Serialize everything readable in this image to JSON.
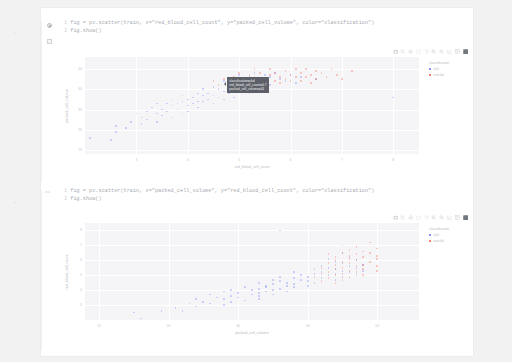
{
  "notebook": {
    "cells": [
      {
        "marker": "run-indicator",
        "gutter": "",
        "lines": [
          {
            "n": "1",
            "text": "fig = px.scatter(train, x=\"red_blood_cell_count\", y=\"packed_cell_volume\", color=\"classification\")"
          },
          {
            "n": "2",
            "text": "fig.show()"
          }
        ],
        "output_icon": "output-collapse-icon"
      },
      {
        "marker": "execution-count",
        "gutter": "xc",
        "lines": [
          {
            "n": "1",
            "text": "fig = px.scatter(train, x=\"packed_cell_volume\", y=\"red_blood_cell_count\", color=\"classification\")"
          },
          {
            "n": "2",
            "text": "fig.show()"
          }
        ],
        "output_icon": ""
      }
    ]
  },
  "modebar": {
    "buttons": [
      {
        "icon": "camera-icon",
        "label": "Download plot as a png"
      },
      {
        "icon": "zoom-icon",
        "label": "Zoom"
      },
      {
        "icon": "pan-icon",
        "label": "Pan"
      },
      {
        "icon": "select-box-icon",
        "label": "Box Select"
      },
      {
        "icon": "lasso-icon",
        "label": "Lasso Select"
      },
      {
        "icon": "zoom-in-icon",
        "label": "Zoom in"
      },
      {
        "icon": "zoom-out-icon",
        "label": "Zoom out"
      },
      {
        "icon": "autoscale-icon",
        "label": "Autoscale"
      },
      {
        "icon": "reset-axes-icon",
        "label": "Reset axes"
      },
      {
        "icon": "plotly-logo-icon",
        "label": "Produced with Plotly"
      }
    ]
  },
  "colors": {
    "ckd": "#636efa",
    "notckd": "#ef553b",
    "plot_bg": "#f5f5f7",
    "grid": "#ffffff",
    "tooltip_bg": "#5d6068"
  },
  "tooltip": {
    "lines": [
      "classification=ckd",
      "red_blood_cell_count=4.7",
      "packed_cell_volume=44"
    ]
  },
  "chart_data": [
    {
      "type": "scatter",
      "title": "",
      "xlabel": "red_blood_cell_count",
      "ylabel": "packed_cell_volume",
      "xlim": [
        2.0,
        8.5
      ],
      "ylim": [
        8,
        56
      ],
      "xticks": [
        "3",
        "4",
        "5",
        "6",
        "7",
        "8"
      ],
      "yticks": [
        "10",
        "20",
        "30",
        "40",
        "50"
      ],
      "grid": true,
      "legend": {
        "title": "classification",
        "position": "right",
        "entries": [
          "ckd",
          "notckd"
        ]
      },
      "series": [
        {
          "name": "ckd",
          "color": "#636efa",
          "points": [
            [
              2.1,
              16
            ],
            [
              2.5,
              15
            ],
            [
              2.6,
              22
            ],
            [
              2.6,
              19
            ],
            [
              2.8,
              21
            ],
            [
              2.9,
              24
            ],
            [
              3.0,
              28
            ],
            [
              3.1,
              26
            ],
            [
              3.1,
              23
            ],
            [
              3.2,
              29
            ],
            [
              3.2,
              25
            ],
            [
              3.3,
              31
            ],
            [
              3.4,
              28
            ],
            [
              3.4,
              33
            ],
            [
              3.4,
              24
            ],
            [
              3.5,
              30
            ],
            [
              3.5,
              27
            ],
            [
              3.6,
              33
            ],
            [
              3.6,
              29
            ],
            [
              3.7,
              32
            ],
            [
              3.7,
              26
            ],
            [
              3.7,
              35
            ],
            [
              3.8,
              33
            ],
            [
              3.8,
              30
            ],
            [
              3.9,
              34
            ],
            [
              3.9,
              28
            ],
            [
              3.9,
              37
            ],
            [
              4.0,
              32
            ],
            [
              4.0,
              35
            ],
            [
              4.0,
              29
            ],
            [
              4.1,
              36
            ],
            [
              4.1,
              33
            ],
            [
              4.2,
              38
            ],
            [
              4.2,
              34
            ],
            [
              4.2,
              31
            ],
            [
              4.3,
              37
            ],
            [
              4.3,
              40
            ],
            [
              4.3,
              34
            ],
            [
              4.4,
              38
            ],
            [
              4.4,
              35
            ],
            [
              4.5,
              41
            ],
            [
              4.5,
              37
            ],
            [
              4.5,
              33
            ],
            [
              4.6,
              40
            ],
            [
              4.6,
              36
            ],
            [
              4.7,
              44
            ],
            [
              4.7,
              39
            ],
            [
              4.7,
              35
            ],
            [
              4.8,
              42
            ],
            [
              4.8,
              38
            ],
            [
              4.9,
              45
            ],
            [
              4.9,
              40
            ],
            [
              4.9,
              36
            ],
            [
              5.0,
              43
            ],
            [
              5.0,
              39
            ],
            [
              5.0,
              47
            ],
            [
              5.1,
              44
            ],
            [
              5.1,
              41
            ],
            [
              5.2,
              46
            ],
            [
              5.2,
              42
            ],
            [
              5.2,
              38
            ],
            [
              5.3,
              45
            ],
            [
              5.3,
              48
            ],
            [
              5.4,
              44
            ],
            [
              5.4,
              41
            ],
            [
              5.5,
              47
            ],
            [
              5.5,
              43
            ],
            [
              5.6,
              46
            ],
            [
              5.6,
              42
            ],
            [
              5.7,
              48
            ],
            [
              5.8,
              45
            ],
            [
              5.9,
              44
            ],
            [
              6.0,
              47
            ],
            [
              6.1,
              43
            ],
            [
              6.2,
              46
            ],
            [
              6.5,
              45
            ],
            [
              8.0,
              36
            ]
          ]
        },
        {
          "name": "notckd",
          "color": "#ef553b",
          "points": [
            [
              4.5,
              44
            ],
            [
              4.6,
              42
            ],
            [
              4.7,
              45
            ],
            [
              4.8,
              43
            ],
            [
              4.9,
              46
            ],
            [
              4.9,
              41
            ],
            [
              5.0,
              44
            ],
            [
              5.0,
              48
            ],
            [
              5.1,
              45
            ],
            [
              5.1,
              42
            ],
            [
              5.2,
              47
            ],
            [
              5.2,
              43
            ],
            [
              5.3,
              46
            ],
            [
              5.3,
              50
            ],
            [
              5.4,
              44
            ],
            [
              5.4,
              48
            ],
            [
              5.5,
              45
            ],
            [
              5.5,
              42
            ],
            [
              5.6,
              47
            ],
            [
              5.6,
              50
            ],
            [
              5.7,
              44
            ],
            [
              5.7,
              48
            ],
            [
              5.8,
              46
            ],
            [
              5.8,
              43
            ],
            [
              5.9,
              49
            ],
            [
              5.9,
              45
            ],
            [
              6.0,
              47
            ],
            [
              6.0,
              44
            ],
            [
              6.1,
              50
            ],
            [
              6.1,
              46
            ],
            [
              6.2,
              48
            ],
            [
              6.2,
              44
            ],
            [
              6.3,
              46
            ],
            [
              6.3,
              50
            ],
            [
              6.4,
              47
            ],
            [
              6.4,
              43
            ],
            [
              6.5,
              49
            ],
            [
              6.5,
              45
            ],
            [
              6.6,
              48
            ],
            [
              6.7,
              46
            ],
            [
              6.8,
              50
            ],
            [
              6.9,
              47
            ],
            [
              7.0,
              45
            ],
            [
              7.2,
              49
            ]
          ]
        }
      ]
    },
    {
      "type": "scatter",
      "title": "",
      "xlabel": "packed_cell_volume",
      "ylabel": "red_blood_cell_count",
      "xlim": [
        8,
        56
      ],
      "ylim": [
        2.0,
        8.5
      ],
      "xticks": [
        "10",
        "20",
        "30",
        "40",
        "50"
      ],
      "yticks": [
        "3",
        "4",
        "5",
        "6",
        "7",
        "8"
      ],
      "grid": true,
      "legend": {
        "title": "classification",
        "position": "right",
        "entries": [
          "ckd",
          "notckd"
        ]
      },
      "series": [
        {
          "name": "ckd",
          "color": "#636efa",
          "points": [
            [
              16,
              2.1
            ],
            [
              15,
              2.5
            ],
            [
              22,
              2.6
            ],
            [
              19,
              2.6
            ],
            [
              21,
              2.8
            ],
            [
              24,
              2.9
            ],
            [
              28,
              3.0
            ],
            [
              26,
              3.1
            ],
            [
              23,
              3.1
            ],
            [
              29,
              3.2
            ],
            [
              25,
              3.2
            ],
            [
              31,
              3.3
            ],
            [
              28,
              3.4
            ],
            [
              33,
              3.4
            ],
            [
              24,
              3.4
            ],
            [
              30,
              3.5
            ],
            [
              27,
              3.5
            ],
            [
              33,
              3.6
            ],
            [
              29,
              3.6
            ],
            [
              32,
              3.7
            ],
            [
              26,
              3.7
            ],
            [
              35,
              3.7
            ],
            [
              33,
              3.8
            ],
            [
              30,
              3.8
            ],
            [
              34,
              3.9
            ],
            [
              28,
              3.9
            ],
            [
              37,
              3.9
            ],
            [
              32,
              4.0
            ],
            [
              35,
              4.0
            ],
            [
              29,
              4.0
            ],
            [
              36,
              4.1
            ],
            [
              33,
              4.1
            ],
            [
              38,
              4.2
            ],
            [
              34,
              4.2
            ],
            [
              31,
              4.2
            ],
            [
              37,
              4.3
            ],
            [
              40,
              4.3
            ],
            [
              34,
              4.3
            ],
            [
              38,
              4.4
            ],
            [
              35,
              4.4
            ],
            [
              41,
              4.5
            ],
            [
              37,
              4.5
            ],
            [
              33,
              4.5
            ],
            [
              40,
              4.6
            ],
            [
              36,
              4.6
            ],
            [
              44,
              4.7
            ],
            [
              39,
              4.7
            ],
            [
              35,
              4.7
            ],
            [
              42,
              4.8
            ],
            [
              38,
              4.8
            ],
            [
              45,
              4.9
            ],
            [
              40,
              4.9
            ],
            [
              36,
              4.9
            ],
            [
              43,
              5.0
            ],
            [
              39,
              5.0
            ],
            [
              47,
              5.0
            ],
            [
              44,
              5.1
            ],
            [
              41,
              5.1
            ],
            [
              46,
              5.2
            ],
            [
              42,
              5.2
            ],
            [
              38,
              5.2
            ],
            [
              45,
              5.3
            ],
            [
              48,
              5.3
            ],
            [
              44,
              5.4
            ],
            [
              41,
              5.4
            ],
            [
              47,
              5.5
            ],
            [
              43,
              5.5
            ],
            [
              46,
              5.6
            ],
            [
              42,
              5.6
            ],
            [
              48,
              5.7
            ],
            [
              45,
              5.8
            ],
            [
              44,
              5.9
            ],
            [
              47,
              6.0
            ],
            [
              43,
              6.1
            ],
            [
              46,
              6.2
            ],
            [
              45,
              6.5
            ],
            [
              36,
              8.0
            ]
          ]
        },
        {
          "name": "notckd",
          "color": "#ef553b",
          "points": [
            [
              44,
              4.5
            ],
            [
              42,
              4.6
            ],
            [
              45,
              4.7
            ],
            [
              43,
              4.8
            ],
            [
              46,
              4.9
            ],
            [
              41,
              4.9
            ],
            [
              44,
              5.0
            ],
            [
              48,
              5.0
            ],
            [
              45,
              5.1
            ],
            [
              42,
              5.1
            ],
            [
              47,
              5.2
            ],
            [
              43,
              5.2
            ],
            [
              46,
              5.3
            ],
            [
              50,
              5.3
            ],
            [
              44,
              5.4
            ],
            [
              48,
              5.4
            ],
            [
              45,
              5.5
            ],
            [
              42,
              5.5
            ],
            [
              47,
              5.6
            ],
            [
              50,
              5.6
            ],
            [
              44,
              5.7
            ],
            [
              48,
              5.7
            ],
            [
              46,
              5.8
            ],
            [
              43,
              5.8
            ],
            [
              49,
              5.9
            ],
            [
              45,
              5.9
            ],
            [
              47,
              6.0
            ],
            [
              44,
              6.0
            ],
            [
              50,
              6.1
            ],
            [
              46,
              6.1
            ],
            [
              48,
              6.2
            ],
            [
              44,
              6.2
            ],
            [
              46,
              6.3
            ],
            [
              50,
              6.3
            ],
            [
              47,
              6.4
            ],
            [
              43,
              6.4
            ],
            [
              49,
              6.5
            ],
            [
              45,
              6.5
            ],
            [
              48,
              6.6
            ],
            [
              46,
              6.7
            ],
            [
              50,
              6.8
            ],
            [
              47,
              6.9
            ],
            [
              45,
              7.0
            ],
            [
              49,
              7.2
            ]
          ]
        }
      ]
    }
  ]
}
